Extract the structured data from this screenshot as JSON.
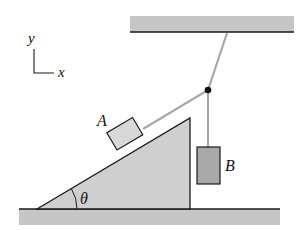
{
  "diagram": {
    "type": "physics-free-body-setup",
    "axes": {
      "y_label": "y",
      "x_label": "x"
    },
    "blocks": [
      {
        "id": "A",
        "label": "A",
        "position": "on incline"
      },
      {
        "id": "B",
        "label": "B",
        "position": "hanging"
      }
    ],
    "angle_label": "θ",
    "colors": {
      "surface_fill": "#c4c4c4",
      "incline_fill": "#cfcfcf",
      "block_a_fill": "#d8d8d8",
      "block_b_fill": "#a9a9a9",
      "rope": "#a8a8a8",
      "outline": "#1a1a1a"
    }
  }
}
